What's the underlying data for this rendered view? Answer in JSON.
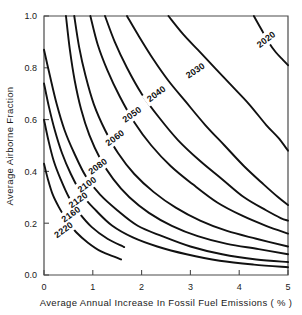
{
  "chart_data": {
    "type": "line",
    "title": "",
    "subtitle": "",
    "xlabel": "Average  Annual  Increase  In  Fossil  Fuel  Emissions  ( % )",
    "ylabel": "Average  Airborne  Fraction",
    "xlim": [
      0,
      5
    ],
    "ylim": [
      0.0,
      1.0
    ],
    "xticks": [
      0,
      1,
      2,
      3,
      4,
      5
    ],
    "xticklabels": [
      "0",
      "1",
      "2",
      "3",
      "4",
      "5"
    ],
    "yticks": [
      0.0,
      0.2,
      0.4,
      0.6,
      0.8,
      1.0
    ],
    "yticklabels": [
      "0.0",
      "0.2",
      "0.4",
      "0.6",
      "0.8",
      "1.0"
    ],
    "grid": false,
    "legend": "none",
    "contour_description": "Iso-year contours of doubling/threshold year as a function of emission growth rate and airborne fraction; each curve is a hyperbola-like level set decreasing from upper-left to lower-right.",
    "contours": [
      {
        "level": "2020",
        "label": "2020",
        "label_x": 4.55,
        "label_y": 0.91,
        "label_rotation": -37,
        "points": [
          [
            4.3,
            1.0
          ],
          [
            4.45,
            0.95
          ],
          [
            4.6,
            0.9
          ],
          [
            4.75,
            0.86
          ],
          [
            4.9,
            0.83
          ],
          [
            5.0,
            0.81
          ]
        ]
      },
      {
        "level": "2030",
        "label": "2030",
        "label_x": 3.1,
        "label_y": 0.79,
        "label_rotation": -34,
        "points": [
          [
            2.55,
            1.0
          ],
          [
            2.85,
            0.93
          ],
          [
            3.15,
            0.87
          ],
          [
            3.5,
            0.8
          ],
          [
            3.85,
            0.73
          ],
          [
            4.2,
            0.66
          ],
          [
            4.55,
            0.58
          ],
          [
            4.8,
            0.53
          ],
          [
            5.0,
            0.48
          ]
        ]
      },
      {
        "level": "2040",
        "label": "2040",
        "label_x": 2.3,
        "label_y": 0.7,
        "label_rotation": -36,
        "points": [
          [
            1.7,
            1.0
          ],
          [
            1.95,
            0.92
          ],
          [
            2.25,
            0.83
          ],
          [
            2.55,
            0.75
          ],
          [
            2.9,
            0.67
          ],
          [
            3.3,
            0.58
          ],
          [
            3.7,
            0.5
          ],
          [
            4.1,
            0.42
          ],
          [
            4.5,
            0.35
          ],
          [
            4.8,
            0.3
          ],
          [
            5.0,
            0.27
          ]
        ]
      },
      {
        "level": "2050",
        "label": "2050",
        "label_x": 1.8,
        "label_y": 0.62,
        "label_rotation": -36,
        "points": [
          [
            1.25,
            1.0
          ],
          [
            1.45,
            0.9
          ],
          [
            1.7,
            0.8
          ],
          [
            2.0,
            0.7
          ],
          [
            2.35,
            0.61
          ],
          [
            2.75,
            0.52
          ],
          [
            3.2,
            0.44
          ],
          [
            3.65,
            0.37
          ],
          [
            4.1,
            0.3
          ],
          [
            4.55,
            0.25
          ],
          [
            4.85,
            0.22
          ],
          [
            5.0,
            0.21
          ]
        ]
      },
      {
        "level": "2060",
        "label": "2060",
        "label_x": 1.45,
        "label_y": 0.53,
        "label_rotation": -36,
        "points": [
          [
            0.95,
            1.0
          ],
          [
            1.1,
            0.89
          ],
          [
            1.3,
            0.79
          ],
          [
            1.55,
            0.69
          ],
          [
            1.85,
            0.59
          ],
          [
            2.2,
            0.5
          ],
          [
            2.6,
            0.42
          ],
          [
            3.05,
            0.35
          ],
          [
            3.55,
            0.28
          ],
          [
            4.05,
            0.23
          ],
          [
            4.55,
            0.19
          ],
          [
            5.0,
            0.16
          ]
        ]
      },
      {
        "level": "2080",
        "label": "2080",
        "label_x": 1.1,
        "label_y": 0.42,
        "label_rotation": -36,
        "points": [
          [
            0.62,
            1.0
          ],
          [
            0.72,
            0.88
          ],
          [
            0.85,
            0.77
          ],
          [
            1.02,
            0.66
          ],
          [
            1.25,
            0.56
          ],
          [
            1.52,
            0.47
          ],
          [
            1.85,
            0.39
          ],
          [
            2.25,
            0.32
          ],
          [
            2.7,
            0.26
          ],
          [
            3.2,
            0.21
          ],
          [
            3.75,
            0.17
          ],
          [
            4.35,
            0.14
          ],
          [
            5.0,
            0.11
          ]
        ]
      },
      {
        "level": "2100",
        "label": "2100",
        "label_x": 0.88,
        "label_y": 0.35,
        "label_rotation": -36,
        "points": [
          [
            0.45,
            1.0
          ],
          [
            0.53,
            0.87
          ],
          [
            0.63,
            0.75
          ],
          [
            0.76,
            0.64
          ],
          [
            0.93,
            0.54
          ],
          [
            1.15,
            0.45
          ],
          [
            1.42,
            0.37
          ],
          [
            1.75,
            0.3
          ],
          [
            2.15,
            0.24
          ],
          [
            2.62,
            0.19
          ],
          [
            3.15,
            0.15
          ],
          [
            3.75,
            0.12
          ],
          [
            4.4,
            0.1
          ],
          [
            5.0,
            0.08
          ]
        ]
      },
      {
        "level": "2120",
        "label": "2120",
        "label_x": 0.7,
        "label_y": 0.29,
        "label_rotation": -36,
        "points": [
          [
            0.0,
            0.87
          ],
          [
            0.12,
            0.77
          ],
          [
            0.26,
            0.66
          ],
          [
            0.42,
            0.56
          ],
          [
            0.62,
            0.47
          ],
          [
            0.86,
            0.38
          ],
          [
            1.15,
            0.31
          ],
          [
            1.5,
            0.25
          ],
          [
            1.92,
            0.19
          ],
          [
            2.42,
            0.15
          ],
          [
            3.0,
            0.11
          ],
          [
            3.65,
            0.08
          ],
          [
            4.35,
            0.06
          ],
          [
            5.0,
            0.05
          ]
        ]
      },
      {
        "level": "2160",
        "label": "2160",
        "label_x": 0.55,
        "label_y": 0.235,
        "label_rotation": -36,
        "points": [
          [
            0.0,
            0.74
          ],
          [
            0.1,
            0.65
          ],
          [
            0.22,
            0.56
          ],
          [
            0.37,
            0.47
          ],
          [
            0.55,
            0.39
          ],
          [
            0.78,
            0.31
          ],
          [
            1.06,
            0.25
          ],
          [
            1.4,
            0.19
          ],
          [
            1.82,
            0.145
          ],
          [
            2.32,
            0.11
          ],
          [
            2.92,
            0.08
          ],
          [
            3.6,
            0.055
          ],
          [
            4.3,
            0.04
          ],
          [
            5.0,
            0.03
          ]
        ]
      },
      {
        "level": "2220",
        "label": "2220",
        "label_x": 0.4,
        "label_y": 0.175,
        "label_rotation": -36,
        "points": [
          [
            0.0,
            0.6
          ],
          [
            0.09,
            0.52
          ],
          [
            0.2,
            0.44
          ],
          [
            0.34,
            0.37
          ],
          [
            0.51,
            0.3
          ],
          [
            0.72,
            0.24
          ],
          [
            0.98,
            0.185
          ],
          [
            1.3,
            0.14
          ],
          [
            1.62,
            0.11
          ],
          [
            1.62,
            0.11
          ]
        ]
      },
      {
        "level": "2260",
        "label": "",
        "label_x": 0,
        "label_y": 0,
        "label_rotation": 0,
        "points": [
          [
            0.0,
            0.43
          ],
          [
            0.08,
            0.37
          ],
          [
            0.18,
            0.31
          ],
          [
            0.31,
            0.26
          ],
          [
            0.47,
            0.21
          ],
          [
            0.66,
            0.165
          ],
          [
            0.9,
            0.125
          ],
          [
            1.18,
            0.09
          ],
          [
            1.45,
            0.07
          ],
          [
            1.58,
            0.06
          ]
        ]
      }
    ],
    "colors": {
      "contour": "#111111",
      "axis": "#4a4a4a",
      "background": "#ffffff",
      "text": "#1a1a1a"
    }
  }
}
